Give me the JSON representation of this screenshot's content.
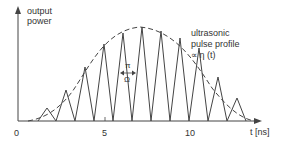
{
  "chart_data": {
    "type": "line",
    "title": "",
    "ylabel": "output power",
    "xlabel": "t [ns]",
    "x_ticks": [
      "0",
      "5",
      "10"
    ],
    "annotations": {
      "envelope_label_line1": "ultrasonic",
      "envelope_label_line2": "pulse profile",
      "envelope_label_line3": "∝ η (t)",
      "period_label_top": "π",
      "period_label_bottom": "Ω"
    },
    "series": [
      {
        "name": "output power pulses",
        "style": "solid",
        "peaks_t_ns": [
          1.7,
          2.8,
          3.9,
          5.0,
          6.1,
          7.2,
          8.3,
          9.4,
          10.5,
          11.6,
          12.7
        ],
        "peaks_rel": [
          0.12,
          0.31,
          0.57,
          0.8,
          0.96,
          1.0,
          0.97,
          0.82,
          0.5,
          0.29,
          0.14
        ]
      },
      {
        "name": "ultrasonic pulse profile",
        "style": "dashed",
        "shape": "bell envelope",
        "t_range": [
          0.5,
          14
        ],
        "peak_t": 7
      }
    ],
    "xlim": [
      0,
      14.5
    ],
    "grid": false
  },
  "colors": {
    "line": "#444444",
    "background": "#ffffff"
  }
}
